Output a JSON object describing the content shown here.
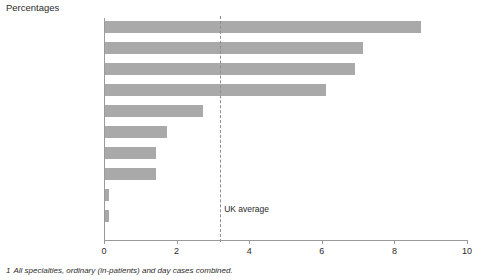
{
  "title": "Percentages",
  "footnote_marker": "1",
  "footnote": "All specialties, ordinary (in-patients) and day cases combined.",
  "reference": {
    "label": "UK average",
    "value": 3.2
  },
  "colors": {
    "bar": "#a9a9a9",
    "axis": "#9a9a9a",
    "reference_line": "#8e8e8e",
    "text": "#2b2b2b",
    "background": "#ffffff"
  },
  "chart_data": {
    "type": "bar",
    "orientation": "horizontal",
    "title": "Percentages",
    "xlabel": "",
    "ylabel": "",
    "xlim": [
      0,
      10
    ],
    "xticks": [
      0,
      2,
      4,
      6,
      8,
      10
    ],
    "xtick_labels": [
      "0",
      "2",
      "4",
      "6",
      "8",
      "10"
    ],
    "grid": false,
    "legend": "none",
    "categories": [
      "North Thames",
      "South Thames",
      "Wales",
      "Northern Ireland",
      "Anglia and Oxford",
      "Trent",
      "Scotland",
      "Northern and Yorkshire",
      "West Midlands",
      "South and West",
      "North West"
    ],
    "values": [
      8.7,
      7.1,
      6.9,
      6.1,
      2.7,
      1.7,
      1.4,
      1.4,
      0.1,
      0.1,
      0.0
    ],
    "annotations": [
      {
        "label": "UK average",
        "type": "vline",
        "value": 3.2
      }
    ]
  }
}
